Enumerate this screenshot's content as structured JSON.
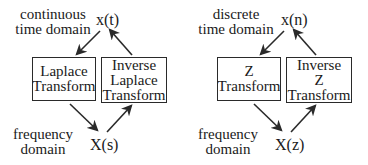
{
  "diagrams": [
    {
      "domain_top_label": [
        "continuous",
        "time domain"
      ],
      "time_signal": "x(t)",
      "forward_box": [
        "Laplace",
        "Transform"
      ],
      "inverse_box": [
        "Inverse",
        "Laplace",
        "Transform"
      ],
      "domain_bottom_label": [
        "frequency",
        "domain"
      ],
      "freq_signal": "X(s)"
    },
    {
      "domain_top_label": [
        "discrete",
        "time domain"
      ],
      "time_signal": "x(n)",
      "forward_box": [
        "Z",
        "Transform"
      ],
      "inverse_box": [
        "Inverse",
        "Z",
        "Transform"
      ],
      "domain_bottom_label": [
        "frequency",
        "domain"
      ],
      "freq_signal": "X(z)"
    }
  ],
  "colors": {
    "line": "#2a2a2a",
    "text": "#1a1a1a",
    "background": "#ffffff"
  }
}
